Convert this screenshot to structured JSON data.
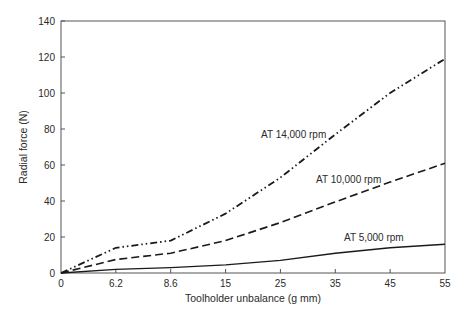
{
  "chart_data": {
    "type": "line",
    "title": "",
    "xlabel": "Toolholder unbalance (g mm)",
    "ylabel": "Radial force (N)",
    "x": [
      "0",
      "6.2",
      "8.6",
      "15",
      "25",
      "35",
      "45",
      "55"
    ],
    "x_scale": "categorical-evenly-spaced",
    "ylim": [
      0,
      140
    ],
    "yticks": [
      0,
      20,
      40,
      60,
      80,
      100,
      120,
      140
    ],
    "grid": false,
    "legend": "inline-labels",
    "series": [
      {
        "name": "AT 14,000 rpm",
        "style": "dash-dot",
        "values": [
          0,
          14,
          18,
          33,
          53,
          77,
          100,
          119
        ]
      },
      {
        "name": "AT 10,000 rpm",
        "style": "dashed",
        "values": [
          0,
          7.5,
          11,
          18,
          28,
          39.5,
          50.5,
          61
        ]
      },
      {
        "name": "AT 5,000 rpm",
        "style": "solid",
        "values": [
          0,
          2,
          3,
          4.5,
          7,
          11,
          14,
          16
        ]
      }
    ]
  }
}
